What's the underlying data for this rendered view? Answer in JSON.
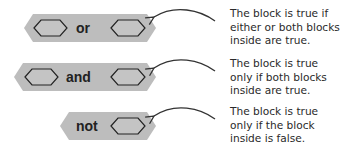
{
  "colors": {
    "block_fill": "#bdbdbd",
    "slot_fill": "#c4c4c4",
    "slot_stroke": "#222222",
    "arrow": "#333333",
    "text": "#2a2a2a"
  },
  "blocks": [
    {
      "id": "or",
      "keyword": "or",
      "slots": 2,
      "description_lines": [
        "The block is true if",
        "either or both blocks",
        "inside are true."
      ]
    },
    {
      "id": "and",
      "keyword": "and",
      "slots": 2,
      "description_lines": [
        "The block is true",
        "only if both blocks",
        "inside are true."
      ]
    },
    {
      "id": "not",
      "keyword": "not",
      "slots": 1,
      "description_lines": [
        "The block is true",
        "only if the block",
        "inside is false."
      ]
    }
  ]
}
